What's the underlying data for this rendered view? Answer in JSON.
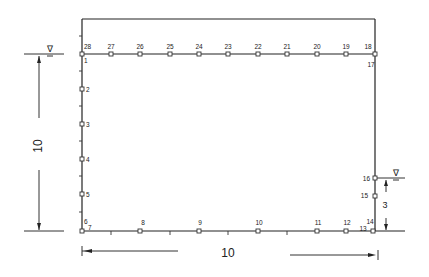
{
  "diagram": {
    "dimensions": {
      "height_left": "10",
      "width_bottom": "10",
      "tailwater_height": "3"
    },
    "water_level_symbol": "∇",
    "nodes": {
      "top": [
        "28",
        "27",
        "26",
        "25",
        "24",
        "23",
        "22",
        "21",
        "20",
        "19",
        "18"
      ],
      "left": [
        "1",
        "2",
        "3",
        "4",
        "5",
        "6"
      ],
      "bottom": [
        "7",
        "8",
        "9",
        "10",
        "11",
        "12",
        "13"
      ],
      "right": [
        "14",
        "15",
        "16",
        "17"
      ]
    }
  }
}
